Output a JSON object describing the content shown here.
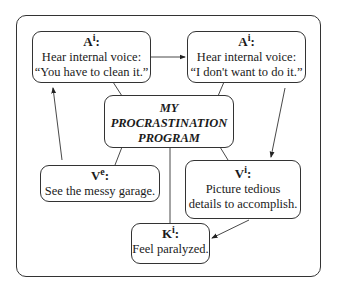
{
  "diagram": {
    "title_lines": [
      "MY",
      "PROCRASTINATION",
      "PROGRAM"
    ],
    "nodes": [
      {
        "id": "a1",
        "code": "A",
        "sup": "i",
        "lines": [
          "Hear internal voice:",
          "“You have to clean it.”"
        ]
      },
      {
        "id": "a2",
        "code": "A",
        "sup": "i",
        "lines": [
          "Hear internal voice:",
          "“I don't want to do it.”"
        ]
      },
      {
        "id": "v2",
        "code": "V",
        "sup": "i",
        "lines": [
          "Picture tedious",
          "details to accomplish."
        ]
      },
      {
        "id": "k1",
        "code": "K",
        "sup": "i",
        "lines": [
          "Feel paralyzed."
        ]
      },
      {
        "id": "v1",
        "code": "V",
        "sup": "e",
        "lines": [
          "See the messy garage."
        ]
      }
    ],
    "arrows": [
      {
        "from": "a1",
        "to": "a2"
      },
      {
        "from": "a2",
        "to": "v2"
      },
      {
        "from": "v2",
        "to": "k1"
      },
      {
        "from": "v1",
        "to": "a1"
      }
    ],
    "colon": ":"
  }
}
